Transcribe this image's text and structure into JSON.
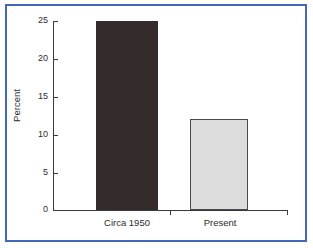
{
  "chart_data": {
    "type": "bar",
    "title": "",
    "xlabel": "",
    "ylabel": "Percent",
    "categories": [
      "Circa 1950",
      "Present"
    ],
    "values": [
      25,
      12
    ],
    "ylim": [
      0,
      25
    ],
    "yticks": [
      0,
      5,
      10,
      15,
      20,
      25
    ],
    "ytick_labels": [
      "0",
      "5",
      "10",
      "15",
      "20",
      "25"
    ],
    "grid": false,
    "legend": "none",
    "series": [
      {
        "name": "Percent",
        "values": [
          25,
          12
        ],
        "bar_colors": [
          "#332c2b",
          "#dcdcdc"
        ],
        "bar_edge_colors": [
          "#332c2b",
          "#4a4a4a"
        ]
      }
    ]
  },
  "figure": {
    "frame_color": "#4169b8",
    "background_color": "#ffffff",
    "axis_color": "#3a3a3a",
    "text_color": "#2b2b2b"
  }
}
